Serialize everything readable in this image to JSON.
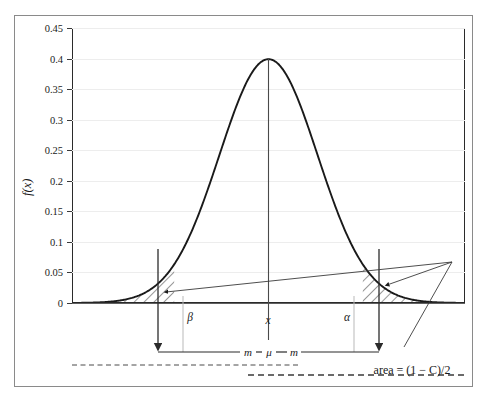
{
  "figure": {
    "y_axis_label": "f(x)",
    "area_annotation": "area = (1 − C)/2",
    "labels": {
      "beta": "β",
      "alpha": "α",
      "x": "x",
      "mu": "μ",
      "m_left": "m",
      "m_right": "m"
    },
    "colors": {
      "curve": "#1a1a1a",
      "axis": "#2b2b2b",
      "grid": "#ededed",
      "frame": "#8a8a8a",
      "hatch": "#1a1a1a",
      "dashed": "#4a4a4a"
    }
  },
  "chart_data": {
    "type": "line",
    "title": "",
    "xlabel": "",
    "ylabel": "f(x)",
    "ylim": [
      0,
      0.45
    ],
    "xlim": [
      -4,
      4
    ],
    "grid": true,
    "legend": null,
    "distribution": "standard normal probability density",
    "peak_value": 0.4,
    "peak_at": "μ",
    "yticks": [
      0,
      0.05,
      0.1,
      0.15,
      0.2,
      0.25,
      0.3,
      0.35,
      0.4,
      0.45
    ],
    "ytick_labels": [
      "0",
      "0.05",
      "0.1",
      "0.15",
      "0.2",
      "0.25",
      "0.3",
      "0.35",
      "0.4",
      "0.45"
    ],
    "x": [
      -4,
      -3.75,
      -3.5,
      -3.25,
      -3,
      -2.75,
      -2.5,
      -2.25,
      -2,
      -1.75,
      -1.5,
      -1.25,
      -1,
      -0.75,
      -0.5,
      -0.25,
      0,
      0.25,
      0.5,
      0.75,
      1,
      1.25,
      1.5,
      1.75,
      2,
      2.25,
      2.5,
      2.75,
      3,
      3.25,
      3.5,
      3.75,
      4
    ],
    "values": [
      0.0001,
      0.0004,
      0.0009,
      0.002,
      0.0044,
      0.0091,
      0.0175,
      0.0317,
      0.054,
      0.0863,
      0.1295,
      0.1826,
      0.242,
      0.3011,
      0.3521,
      0.3867,
      0.3989,
      0.3867,
      0.3521,
      0.3011,
      0.242,
      0.1826,
      0.1295,
      0.0863,
      0.054,
      0.0317,
      0.0175,
      0.0091,
      0.0044,
      0.002,
      0.0009,
      0.0004,
      0.0001
    ],
    "annotations": [
      {
        "label": "β",
        "type": "boundary-marker",
        "side": "left",
        "x": -1.92
      },
      {
        "label": "α",
        "type": "boundary-marker",
        "side": "right",
        "x": 1.92
      },
      {
        "label": "x",
        "type": "center-marker",
        "x": 0
      },
      {
        "label": "μ",
        "type": "center-tick",
        "x": 0
      },
      {
        "label": "m",
        "type": "span",
        "from": "β",
        "to": "μ"
      },
      {
        "label": "m",
        "type": "span",
        "from": "μ",
        "to": "α"
      },
      {
        "label": "area = (1 − C)/2",
        "type": "callout",
        "targets": [
          "left-tail",
          "right-tail"
        ]
      }
    ],
    "shaded_regions": [
      {
        "name": "left-tail",
        "style": "hatched",
        "from": -4,
        "to": -1.92
      },
      {
        "name": "right-tail",
        "style": "hatched",
        "from": 1.92,
        "to": 4
      }
    ]
  }
}
